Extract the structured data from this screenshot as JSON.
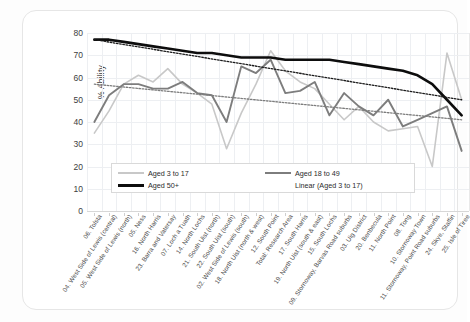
{
  "chart_data": {
    "type": "line",
    "title": "",
    "xlabel": "",
    "ylabel": "% Ability",
    "ylim": [
      0,
      80
    ],
    "yticks": [
      0,
      10,
      20,
      30,
      40,
      50,
      60,
      70,
      80
    ],
    "grid": true,
    "legend_position": "inside-bottom-center",
    "categories": [
      "06. Tolsta",
      "04. West Side of Lewis (central)",
      "05. West Side of Lewis (north)",
      "05. Ness",
      "16. North Harris",
      "23. Barra and Vatersay",
      "07. Loch a Tuath",
      "14. North Lochs",
      "21. South Uist (north)",
      "22. South Uist (south)",
      "02. West Side of Lewis (south)",
      "18. North Uist (north & west)",
      "12. South Point",
      "Total: Research Area",
      "17. South Harris",
      "19. North Uist (south & east)",
      "15. South Lochs",
      "09. Stornoway, Barvas Road suburbs",
      "03. Uig District",
      "20. Benbecula",
      "11. North Point",
      "08. Tong",
      "10. Stornoway Town",
      "11. Stornoway, Point Road suburbs",
      "24. Skye, Staffin",
      "25. Isle of Tiree"
    ],
    "series": [
      {
        "name": "Aged 3 to 17",
        "color": "#c8c8c8",
        "values": [
          35,
          45,
          57,
          61,
          58,
          64,
          57,
          53,
          48,
          28,
          44,
          57,
          72,
          63,
          58,
          55,
          48,
          41,
          47,
          40,
          36,
          37,
          38,
          20,
          71,
          50
        ]
      },
      {
        "name": "Aged 18 to 49",
        "color": "#7d7d7d",
        "values": [
          40,
          52,
          57,
          57,
          55,
          55,
          58,
          53,
          52,
          40,
          65,
          62,
          68,
          53,
          54,
          58,
          43,
          53,
          47,
          43,
          50,
          38,
          41,
          44,
          47,
          27
        ]
      },
      {
        "name": "Aged 50+",
        "color": "#0d0d0d",
        "values": [
          77,
          77,
          76,
          75,
          74,
          73,
          72,
          71,
          71,
          70,
          69,
          69,
          69,
          68,
          68,
          68,
          68,
          67,
          66,
          65,
          64,
          63,
          61,
          57,
          50,
          43
        ]
      }
    ],
    "trendlines": [
      {
        "name": "Linear (Aged 3 to 17)",
        "of_series": "Aged 3 to 17",
        "color": "#7d7d7d",
        "style": "dotted",
        "start_value": 57,
        "end_value": 41
      },
      {
        "name": "Linear (Aged 50+)",
        "of_series": "Aged 50+",
        "color": "#1a1a1a",
        "style": "dotted",
        "start_value": 77,
        "end_value": 50
      }
    ],
    "legend_entries": [
      "Aged 3 to 17",
      "Aged 18 to 49",
      "Aged 50+",
      "Linear (Aged 3 to 17)"
    ]
  },
  "legend": {
    "child": "Aged 3 to 17",
    "adult": "Aged 18 to 49",
    "senior": "Aged 50+",
    "trend": "Linear (Aged 3 to 17)"
  },
  "axes": {
    "y_title": "% Ability"
  }
}
